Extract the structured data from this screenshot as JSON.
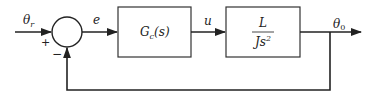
{
  "diagram": {
    "type": "block-diagram",
    "colors": {
      "line": "#222222",
      "background": "#ffffff"
    },
    "signals": {
      "reference": {
        "symbol": "θ",
        "subscript": "r"
      },
      "error": "e",
      "control": "u",
      "output": {
        "symbol": "θ",
        "subscript": "0"
      }
    },
    "summing_junction": {
      "plus_sign": "+",
      "minus_sign": "−"
    },
    "blocks": [
      {
        "id": "controller",
        "label": {
          "main": "G",
          "subscript": "c",
          "arg": "(s)"
        }
      },
      {
        "id": "plant",
        "numerator": "L",
        "denominator": {
          "main": "Js",
          "power": "2"
        }
      }
    ],
    "feedback": "unity, negative"
  }
}
